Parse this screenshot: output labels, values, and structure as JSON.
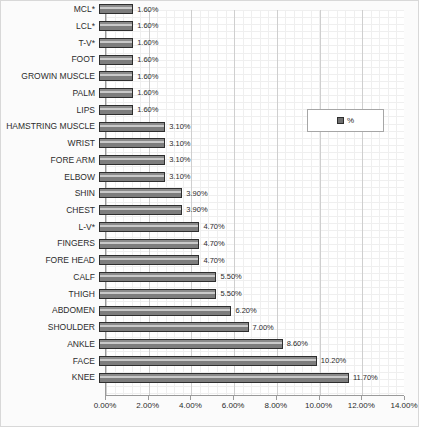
{
  "chart_data": {
    "type": "bar",
    "orientation": "horizontal",
    "title": "",
    "xlabel": "",
    "ylabel": "",
    "xlim": [
      0,
      14
    ],
    "xticks": [
      "0.00%",
      "2.00%",
      "4.00%",
      "6.00%",
      "8.00%",
      "10.00%",
      "12.00%",
      "14.00%"
    ],
    "xtick_values": [
      0,
      2,
      4,
      6,
      8,
      10,
      12,
      14
    ],
    "grid": true,
    "legend": {
      "position": "upper-right-inside",
      "entries": [
        {
          "label": "%",
          "color": "#6f6f6f"
        }
      ]
    },
    "categories": [
      "MCL*",
      "LCL*",
      "T-V*",
      "FOOT",
      "GROWIN MUSCLE",
      "PALM",
      "LIPS",
      "HAMSTRING MUSCLE",
      "WRIST",
      "FORE ARM",
      "ELBOW",
      "SHIN",
      "CHEST",
      "L-V*",
      "FINGERS",
      "FORE HEAD",
      "CALF",
      "THIGH",
      "ABDOMEN",
      "SHOULDER",
      "ANKLE",
      "FACE",
      "KNEE"
    ],
    "values": [
      1.6,
      1.6,
      1.6,
      1.6,
      1.6,
      1.6,
      1.6,
      3.1,
      3.1,
      3.1,
      3.1,
      3.9,
      3.9,
      4.7,
      4.7,
      4.7,
      5.5,
      5.5,
      6.2,
      7.0,
      8.6,
      10.2,
      11.7
    ],
    "data_labels": [
      "1.60%",
      "1.60%",
      "1.60%",
      "1.60%",
      "1.60%",
      "1.60%",
      "1.60%",
      "3.10%",
      "3.10%",
      "3.10%",
      "3.10%",
      "3.90%",
      "3.90%",
      "4.70%",
      "4.70%",
      "4.70%",
      "5.50%",
      "5.50%",
      "6.20%",
      "7.00%",
      "8.60%",
      "10.20%",
      "11.70%"
    ],
    "series_color": "#6f6f6f",
    "bar_border_color": "#2e2e2e"
  }
}
